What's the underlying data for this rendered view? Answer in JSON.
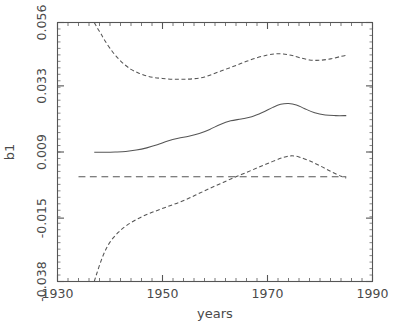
{
  "chart_data": {
    "type": "line",
    "title": "",
    "xlabel": "years",
    "ylabel": "b1",
    "xlim": [
      1930,
      1990
    ],
    "ylim": [
      -0.038,
      0.056
    ],
    "xticks": [
      1930,
      1950,
      1970,
      1990
    ],
    "xtick_labels": [
      "1930",
      "1950",
      "1970",
      "1990"
    ],
    "yticks": [
      -0.038,
      -0.015,
      0.009,
      0.033,
      0.056
    ],
    "ytick_labels": [
      "-0.038",
      "-0.015",
      "0.009",
      "0.033",
      "0.056"
    ],
    "grid": false,
    "legend": "none",
    "minor_ticks": true,
    "series": [
      {
        "name": "upper confidence band",
        "style": "dashed",
        "color": "#555555",
        "x": [
          1937.0,
          1937.6,
          1938.3,
          1939.0,
          1940.0,
          1941.2,
          1942.5,
          1944.0,
          1945.5,
          1947.0,
          1948.5,
          1950.0,
          1952.0,
          1954.0,
          1956.0,
          1958.0,
          1960.0,
          1962.0,
          1964.0,
          1966.0,
          1968.0,
          1970.0,
          1971.5,
          1973.0,
          1974.5,
          1976.0,
          1978.0,
          1980.0,
          1982.0,
          1984.0,
          1985.0
        ],
        "y": [
          0.056,
          0.054,
          0.0518,
          0.0495,
          0.0466,
          0.0437,
          0.0412,
          0.039,
          0.0376,
          0.0366,
          0.036,
          0.0357,
          0.0354,
          0.0354,
          0.0356,
          0.0362,
          0.0376,
          0.039,
          0.0404,
          0.0419,
          0.0432,
          0.0442,
          0.0446,
          0.0446,
          0.0441,
          0.0433,
          0.0424,
          0.0423,
          0.0428,
          0.0437,
          0.0441
        ]
      },
      {
        "name": "fitted estimate",
        "style": "solid",
        "color": "#555555",
        "x": [
          1937.0,
          1939.0,
          1941.0,
          1943.0,
          1945.0,
          1947.0,
          1949.0,
          1951.0,
          1953.0,
          1955.0,
          1957.0,
          1959.0,
          1961.0,
          1963.0,
          1965.0,
          1967.0,
          1969.0,
          1971.0,
          1972.5,
          1974.0,
          1975.5,
          1977.0,
          1979.0,
          1981.0,
          1983.0,
          1985.0
        ],
        "y": [
          0.0089,
          0.0089,
          0.009,
          0.0092,
          0.0097,
          0.0105,
          0.0116,
          0.013,
          0.014,
          0.0147,
          0.0157,
          0.0172,
          0.019,
          0.0203,
          0.021,
          0.0218,
          0.0233,
          0.0252,
          0.0263,
          0.0266,
          0.0261,
          0.0248,
          0.0232,
          0.0224,
          0.0222,
          0.0222
        ]
      },
      {
        "name": "lower confidence band",
        "style": "dashed",
        "color": "#555555",
        "x": [
          1937.0,
          1937.5,
          1938.2,
          1939.0,
          1940.0,
          1941.5,
          1943.0,
          1945.0,
          1947.0,
          1949.0,
          1951.0,
          1953.0,
          1955.0,
          1957.0,
          1959.0,
          1961.0,
          1963.0,
          1965.0,
          1967.0,
          1969.0,
          1971.0,
          1973.0,
          1974.5,
          1976.0,
          1978.0,
          1980.0,
          1982.0,
          1984.0,
          1985.0
        ],
        "y": [
          -0.038,
          -0.035,
          -0.031,
          -0.0272,
          -0.0237,
          -0.0203,
          -0.0179,
          -0.0155,
          -0.0137,
          -0.0122,
          -0.0108,
          -0.0094,
          -0.0078,
          -0.006,
          -0.0042,
          -0.0025,
          -0.0008,
          0.0008,
          0.0024,
          0.004,
          0.0056,
          0.007,
          0.0076,
          0.0072,
          0.0058,
          0.004,
          0.002,
          0.0002,
          -0.0004
        ]
      },
      {
        "name": "zero reference line",
        "style": "long-dashed",
        "color": "#555555",
        "x": [
          1934.0,
          1985.0
        ],
        "y": [
          0.0,
          0.0
        ]
      }
    ]
  },
  "axes": {
    "y_title": "b1",
    "x_title": "years"
  }
}
